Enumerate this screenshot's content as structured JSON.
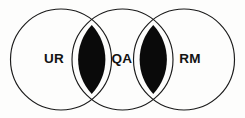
{
  "diagram": {
    "type": "venn",
    "title": "",
    "background_color": "#fdfdfc",
    "stroke_color": "#1a1a1a",
    "intersection_fill": "#0a0a0a",
    "label_color": "#131313",
    "circles": [
      {
        "id": "left",
        "label": "UR",
        "cx": 61.0,
        "cy": 59.5,
        "r": 50.5,
        "label_x": 54,
        "label_y": 59
      },
      {
        "id": "middle",
        "label": "QA",
        "cx": 122.5,
        "cy": 59.5,
        "r": 50.5,
        "label_x": 122,
        "label_y": 59
      },
      {
        "id": "right",
        "label": "RM",
        "cx": 184.0,
        "cy": 59.5,
        "r": 50.5,
        "label_x": 190,
        "label_y": 59
      }
    ],
    "intersections": [
      {
        "id": "left-middle",
        "between": [
          "UR",
          "QA"
        ],
        "filled": true,
        "cx": 91.75,
        "top_y": 25.0,
        "bottom_y": 94.0
      },
      {
        "id": "middle-right",
        "between": [
          "QA",
          "RM"
        ],
        "filled": true,
        "cx": 153.25,
        "top_y": 25.0,
        "bottom_y": 94.0
      }
    ]
  }
}
